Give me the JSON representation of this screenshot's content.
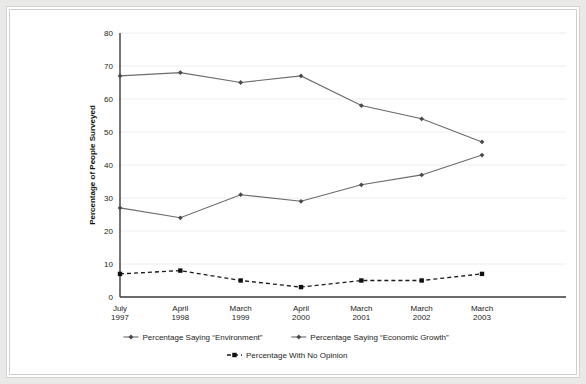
{
  "chart_data": {
    "type": "line",
    "title": "",
    "xlabel": "",
    "ylabel": "Percentage of People Surveyed",
    "ylim": [
      0,
      80
    ],
    "ytick_values": [
      0,
      10,
      20,
      30,
      40,
      50,
      60,
      70,
      80
    ],
    "ytick_labels": [
      "0",
      "10",
      "20",
      "30",
      "40",
      "50",
      "60",
      "70",
      "80"
    ],
    "grid": true,
    "legend_position": "bottom",
    "categories": [
      "July\n1997",
      "April\n1998",
      "March\n1999",
      "April\n2000",
      "March\n2001",
      "March\n2002",
      "March\n2003"
    ],
    "category_lines": [
      [
        "July",
        "1997"
      ],
      [
        "April",
        "1998"
      ],
      [
        "March",
        "1999"
      ],
      [
        "April",
        "2000"
      ],
      [
        "March",
        "2001"
      ],
      [
        "March",
        "2002"
      ],
      [
        "March",
        "2003"
      ]
    ],
    "series": [
      {
        "name": "Percentage Saying “Environment”",
        "values": [
          67,
          68,
          65,
          67,
          58,
          54,
          47
        ],
        "style": "solid",
        "marker": "diamond",
        "color": "#6b6b6b"
      },
      {
        "name": "Percentage Saying “Economic Growth”",
        "values": [
          27,
          24,
          31,
          29,
          34,
          37,
          43
        ],
        "style": "solid",
        "marker": "diamond",
        "color": "#6b6b6b"
      },
      {
        "name": "Percentage With No Opinion",
        "values": [
          7,
          8,
          5,
          3,
          5,
          5,
          7
        ],
        "style": "dashed",
        "marker": "square",
        "color": "#111111"
      }
    ]
  },
  "legend": {
    "entries": [
      "Percentage Saying “Environment”",
      "Percentage Saying “Economic Growth”",
      "Percentage With No Opinion"
    ]
  },
  "axes": {
    "y_title": "Percentage of People Surveyed"
  }
}
